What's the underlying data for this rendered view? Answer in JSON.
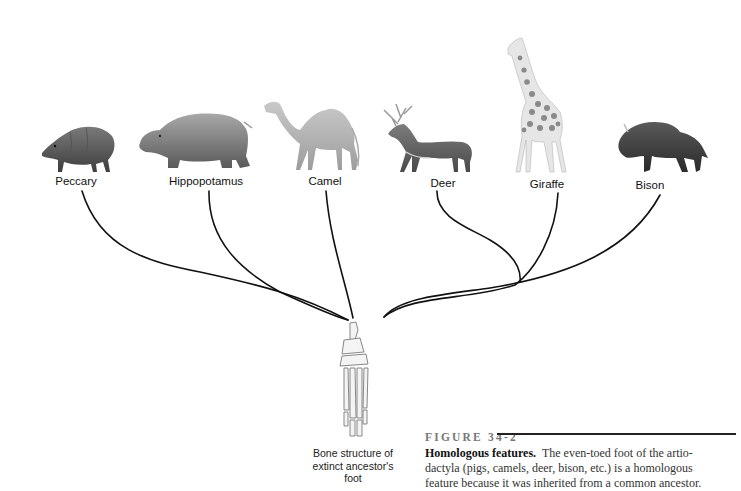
{
  "figure": {
    "number": "FIGURE 34-2",
    "title": "Homologous features.",
    "caption_lines": [
      "The even-toed foot of the artio-",
      "dactyla (pigs, camels, deer, bison, etc.) is a homologous",
      "feature because it was inherited from a common ancestor."
    ]
  },
  "animals": [
    {
      "name": "Peccary",
      "icon": "peccary-icon",
      "label_x": 76,
      "label_y": 175
    },
    {
      "name": "Hippopotamus",
      "icon": "hippopotamus-icon",
      "label_x": 206,
      "label_y": 175
    },
    {
      "name": "Camel",
      "icon": "camel-icon",
      "label_x": 325,
      "label_y": 175
    },
    {
      "name": "Deer",
      "icon": "deer-icon",
      "label_x": 443,
      "label_y": 177
    },
    {
      "name": "Giraffe",
      "icon": "giraffe-icon",
      "label_x": 547,
      "label_y": 178
    },
    {
      "name": "Bison",
      "icon": "bison-icon",
      "label_x": 650,
      "label_y": 179
    }
  ],
  "ancestor": {
    "label_lines": [
      "Bone structure of",
      "extinct ancestor's",
      "foot"
    ],
    "icon": "foot-bones-icon"
  },
  "colors": {
    "lines": "#111111",
    "text": "#111111",
    "caption": "#333333",
    "figure_number": "#777777"
  }
}
